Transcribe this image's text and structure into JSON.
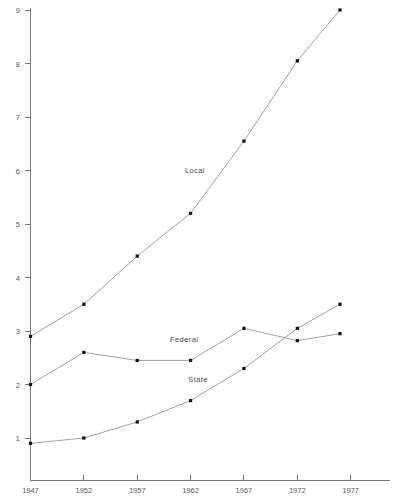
{
  "chart_data": {
    "type": "line",
    "title": "",
    "subtitle": "",
    "xlabel": "",
    "ylabel": "",
    "grid": false,
    "legend_position": "inline-annotations",
    "x": [
      1947,
      1952,
      1957,
      1962,
      1967,
      1972,
      1976
    ],
    "xtick_labels": [
      "1947",
      "1952",
      "1957",
      "1962",
      "1967",
      "1972",
      "1977"
    ],
    "xtick_values": [
      1947,
      1952,
      1957,
      1962,
      1967,
      1972,
      1977
    ],
    "ytick_labels": [
      "1",
      "2",
      "3",
      "4",
      "5",
      "6",
      "7",
      "8",
      "9"
    ],
    "ytick_values": [
      1,
      2,
      3,
      4,
      5,
      6,
      7,
      8,
      9
    ],
    "xlim": [
      1947,
      1979
    ],
    "ylim": [
      0.3,
      9.3
    ],
    "series": [
      {
        "name": "Local",
        "label": "Local",
        "values": [
          2.9,
          3.5,
          4.4,
          5.2,
          6.55,
          8.05,
          9.0
        ]
      },
      {
        "name": "Federal",
        "label": "Federal",
        "values": [
          2.0,
          2.6,
          2.45,
          2.45,
          3.05,
          2.82,
          2.95
        ]
      },
      {
        "name": "State",
        "label": "State",
        "values": [
          0.9,
          1.0,
          1.3,
          1.7,
          2.3,
          3.05,
          3.5
        ]
      }
    ],
    "annotations": [
      {
        "text": "Local",
        "x": 1962.4,
        "y": 5.95
      },
      {
        "text": "Federal",
        "x": 1961.4,
        "y": 2.79
      },
      {
        "text": "State",
        "x": 1962.7,
        "y": 2.04
      }
    ]
  }
}
